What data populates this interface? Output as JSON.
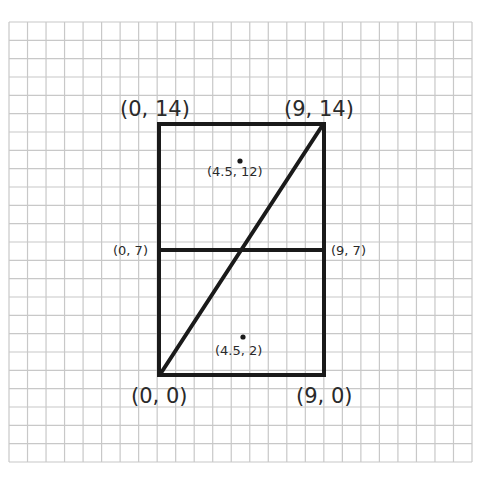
{
  "diagram": {
    "type": "coordinate-grid-rectangle",
    "grid": {
      "columns": 25,
      "rows": 24,
      "line_color": "#c8c8c8"
    },
    "shape": {
      "name": "rectangle",
      "stroke_color": "#1a1a1a",
      "vertices": [
        {
          "label": "(0, 0)",
          "x": 0,
          "y": 0
        },
        {
          "label": "(9, 0)",
          "x": 9,
          "y": 0
        },
        {
          "label": "(9, 14)",
          "x": 9,
          "y": 14
        },
        {
          "label": "(0, 14)",
          "x": 0,
          "y": 14
        }
      ],
      "segments": [
        {
          "name": "midline",
          "from": "(0, 7)",
          "to": "(9, 7)"
        },
        {
          "name": "diagonal",
          "from": "(0, 0)",
          "to": "(9, 14)"
        }
      ]
    },
    "labels": {
      "top_left": "(0, 14)",
      "top_right": "(9, 14)",
      "bottom_left": "(0, 0)",
      "bottom_right": "(9, 0)",
      "mid_left": "(0, 7)",
      "mid_right": "(9, 7)",
      "upper_point": "(4.5, 12)",
      "lower_point": "(4.5, 2)"
    },
    "points": [
      {
        "label": "(4.5, 12)",
        "x": 4.5,
        "y": 12
      },
      {
        "label": "(4.5, 2)",
        "x": 4.5,
        "y": 2
      }
    ]
  }
}
